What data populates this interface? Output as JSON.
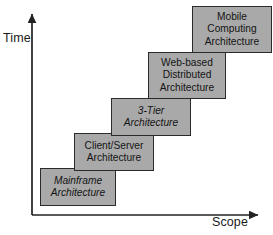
{
  "diagram": {
    "type": "staircase-diagram",
    "background_color": "#ffffff",
    "box_fill_color": "#a9a9a9",
    "box_border_color": "#2b2b2b",
    "axis_color": "#222222"
  },
  "axes": {
    "y": {
      "label": "Time",
      "direction": "up",
      "arrow": true
    },
    "x": {
      "label": "Scope",
      "direction": "right",
      "arrow": true
    }
  },
  "steps": [
    {
      "id": "mainframe",
      "label": "Mainframe\nArchitecture",
      "order": 1,
      "italic": true
    },
    {
      "id": "client-server",
      "label": "Client/Server\nArchitecture",
      "order": 2,
      "italic": false
    },
    {
      "id": "three-tier",
      "label": "3-Tier\nArchitecture",
      "order": 3,
      "italic": true
    },
    {
      "id": "web-based-distributed",
      "label": "Web-based\nDistributed\nArchitecture",
      "order": 4,
      "italic": false
    },
    {
      "id": "mobile-computing",
      "label": "Mobile\nComputing\nArchitecture",
      "order": 5,
      "italic": false
    }
  ]
}
